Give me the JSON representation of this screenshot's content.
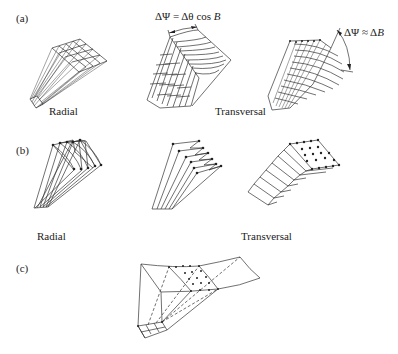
{
  "panels": {
    "a": {
      "label": "(a)",
      "captions": {
        "left": "Radial",
        "right": "Transversal"
      },
      "formulas": {
        "middle": "ΔΨ = Δθ cos ",
        "middle_var": "B",
        "right": "ΔΨ ≈ Δ",
        "right_var": "B"
      }
    },
    "b": {
      "label": "(b)",
      "captions": {
        "left": "Radial",
        "right": "Transversal"
      }
    },
    "c": {
      "label": "(c)"
    }
  }
}
